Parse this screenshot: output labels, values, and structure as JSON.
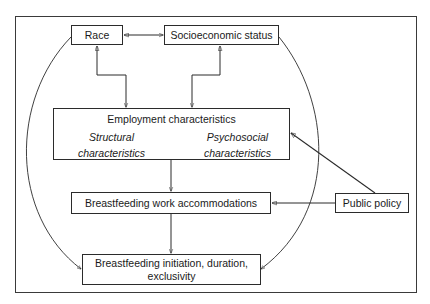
{
  "diagram": {
    "type": "conceptual-framework",
    "nodes": {
      "race": {
        "label": "Race"
      },
      "ses": {
        "label": "Socioeconomic status"
      },
      "employment": {
        "label": "Employment characteristics",
        "structural": {
          "line1": "Structural",
          "line2": "characteristics"
        },
        "psychosocial": {
          "line1": "Psychosocial",
          "line2": "characteristics"
        }
      },
      "accommodations": {
        "label": "Breastfeeding work accommodations"
      },
      "policy": {
        "label": "Public policy"
      },
      "outcome": {
        "line1": "Breastfeeding initiation, duration,",
        "line2": "exclusivity"
      }
    },
    "edges": [
      {
        "from": "Race",
        "to": "Socioeconomic status",
        "type": "bidirectional"
      },
      {
        "from": "Race",
        "to": "Employment characteristics",
        "type": "bidirectional"
      },
      {
        "from": "Socioeconomic status",
        "to": "Employment characteristics",
        "type": "bidirectional"
      },
      {
        "from": "Structural characteristics",
        "to": "Psychosocial characteristics",
        "type": "bidirectional"
      },
      {
        "from": "Employment characteristics",
        "to": "Breastfeeding work accommodations",
        "type": "directed"
      },
      {
        "from": "Breastfeeding work accommodations",
        "to": "Breastfeeding initiation, duration, exclusivity",
        "type": "directed"
      },
      {
        "from": "Public policy",
        "to": "Employment characteristics",
        "type": "directed"
      },
      {
        "from": "Public policy",
        "to": "Breastfeeding work accommodations",
        "type": "directed"
      },
      {
        "from": "Race",
        "to": "Breastfeeding initiation, duration, exclusivity",
        "type": "directed-curved"
      },
      {
        "from": "Socioeconomic status",
        "to": "Breastfeeding initiation, duration, exclusivity",
        "type": "directed-curved"
      }
    ],
    "colors": {
      "stroke": "#2b2b2b",
      "background": "#ffffff",
      "text": "#1a1a1a"
    }
  }
}
